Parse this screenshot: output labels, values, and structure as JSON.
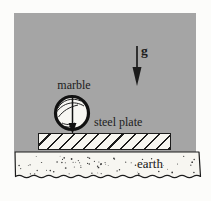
{
  "figure": {
    "labels": {
      "gravity": "g",
      "marble": "marble",
      "steel_plate": "steel plate",
      "earth": "earth"
    },
    "icons": {
      "gravity_arrow": "down-arrow",
      "marble_weight_arrow": "down-arrow"
    },
    "colors": {
      "air_region_gray": "#a5a5a5",
      "paper": "#f7f6f1",
      "ink": "#1c1c1c"
    }
  }
}
